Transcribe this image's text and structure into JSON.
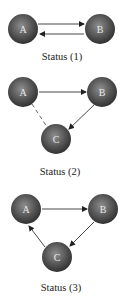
{
  "diagrams": [
    {
      "caption": "Status (1)",
      "nodes": [
        {
          "id": "A",
          "label": "A"
        },
        {
          "id": "B",
          "label": "B"
        }
      ],
      "edges": [
        {
          "from": "A",
          "to": "B",
          "style": "solid"
        },
        {
          "from": "B",
          "to": "A",
          "style": "solid"
        }
      ]
    },
    {
      "caption": "Status (2)",
      "nodes": [
        {
          "id": "A",
          "label": "A"
        },
        {
          "id": "B",
          "label": "B"
        },
        {
          "id": "C",
          "label": "C"
        }
      ],
      "edges": [
        {
          "from": "A",
          "to": "B",
          "style": "solid"
        },
        {
          "from": "B",
          "to": "C",
          "style": "solid"
        },
        {
          "from": "A",
          "to": "C",
          "style": "dashed"
        }
      ]
    },
    {
      "caption": "Status (3)",
      "nodes": [
        {
          "id": "A",
          "label": "A"
        },
        {
          "id": "B",
          "label": "B"
        },
        {
          "id": "C",
          "label": "C"
        }
      ],
      "edges": [
        {
          "from": "A",
          "to": "B",
          "style": "solid"
        },
        {
          "from": "B",
          "to": "C",
          "style": "solid"
        },
        {
          "from": "C",
          "to": "A",
          "style": "solid"
        }
      ]
    }
  ],
  "colors": {
    "node_dark": "#2e2e2e",
    "node_light": "#8a8a8a",
    "edge": "#333333"
  }
}
